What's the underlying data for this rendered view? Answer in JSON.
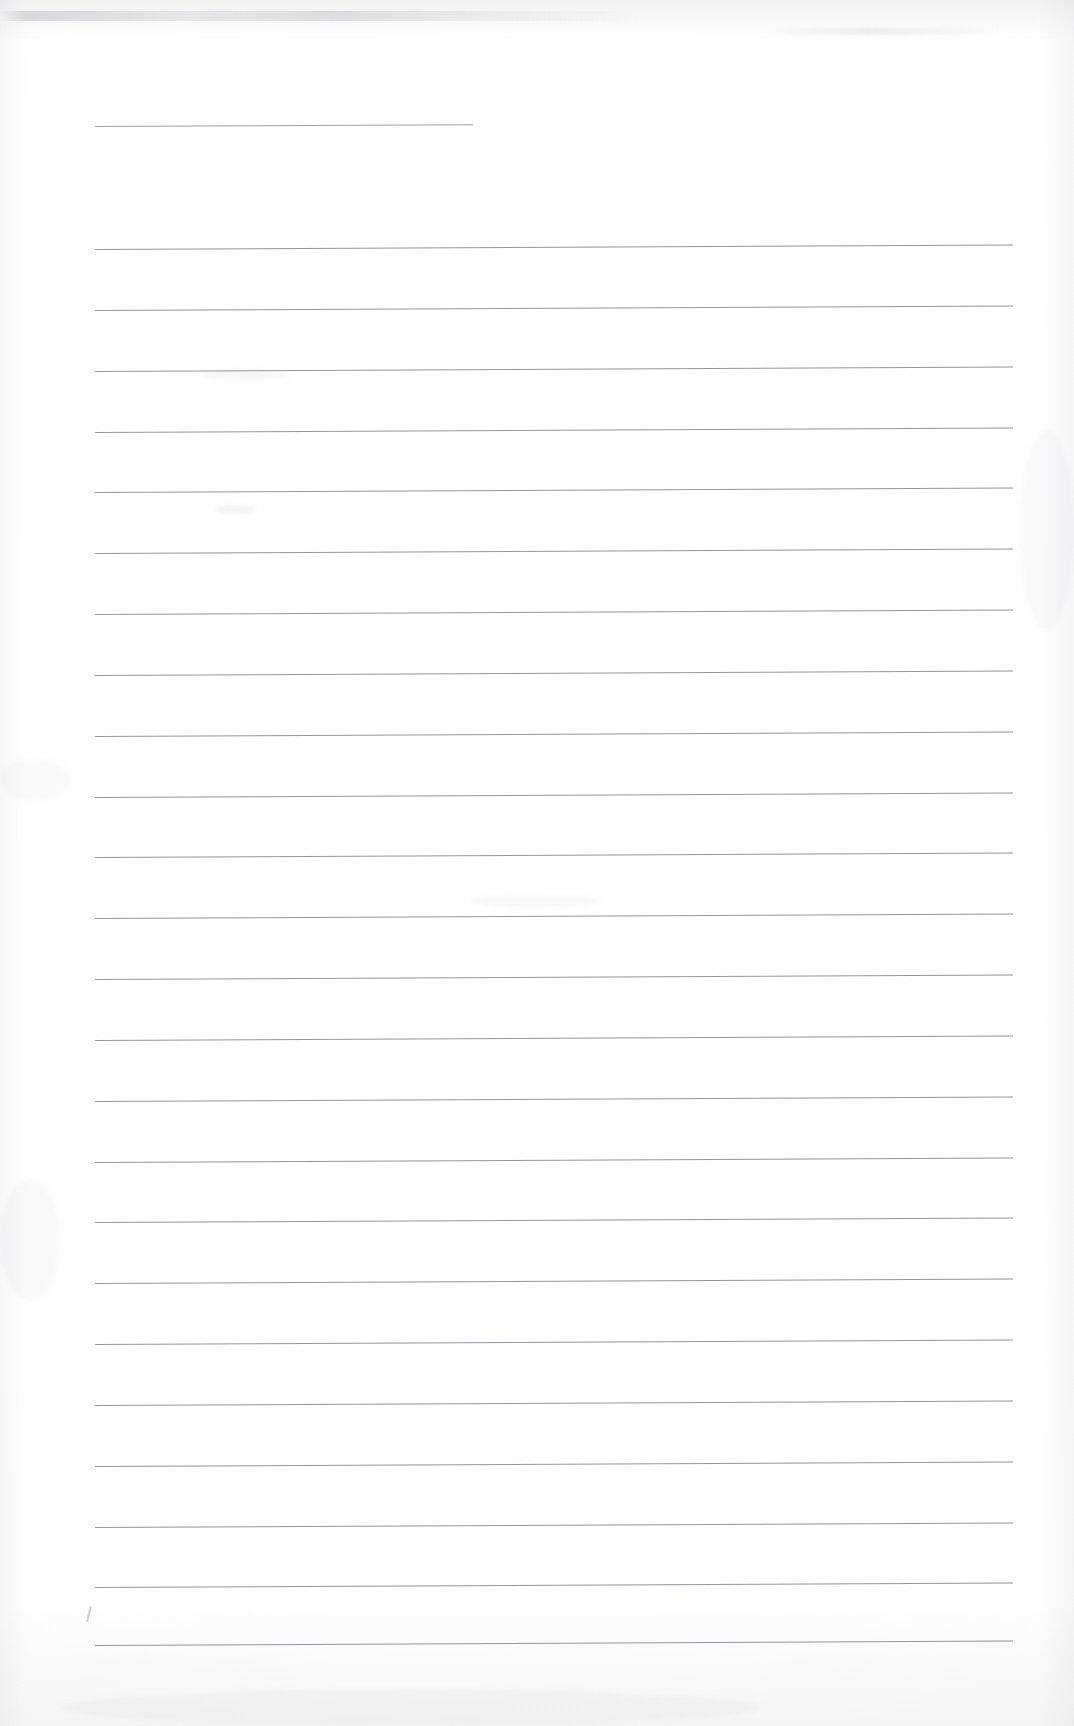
{
  "document": {
    "kind": "scanned-lined-paper",
    "title": "Blank ruled notebook page (scan)",
    "page_width": 1074,
    "page_height": 1726,
    "background_color": "#ffffff",
    "rule_color": "#787880",
    "rule_thickness_px": 1,
    "text_content": "",
    "handwriting_present": "none",
    "header_rule": {
      "label": "header-rule",
      "x_start": 95,
      "x_end": 473,
      "y": 126,
      "skew_deg": -0.25
    },
    "body_rules": {
      "label": "body-rules",
      "count": 24,
      "x_start": 95,
      "x_end": 1013,
      "first_y": 249,
      "spacing_px": 60.7,
      "skew_deg": -0.28,
      "y_positions": [
        249,
        310,
        371,
        432,
        492,
        553,
        614,
        675,
        736,
        797,
        857,
        918,
        979,
        1040,
        1101,
        1162,
        1222,
        1283,
        1344,
        1405,
        1466,
        1527,
        1587,
        1645
      ]
    },
    "margins": {
      "label": "page-margins",
      "left_px": 95,
      "right_px": 61,
      "top_px": 126,
      "bottom_px": 81
    },
    "artifacts": [
      {
        "name": "top-scan-band",
        "x": 0,
        "y": 11,
        "w": 640,
        "h": 10
      },
      {
        "name": "upper-right-smudge",
        "x": 760,
        "y": 28,
        "w": 240,
        "h": 7
      },
      {
        "name": "stray-pencil-tick",
        "x": 88,
        "y": 1608
      }
    ]
  }
}
